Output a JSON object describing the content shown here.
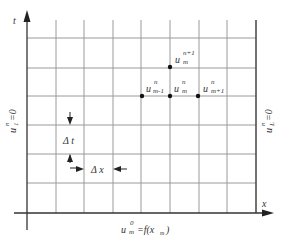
{
  "axes": {
    "t_label": "t",
    "x_label": "x"
  },
  "grid": {
    "columns_x": [
      27,
      56,
      84,
      113,
      141,
      170,
      199,
      227,
      256
    ],
    "rows_y": [
      38,
      68,
      97,
      125,
      154,
      183,
      213
    ],
    "line_color": "#9a9a9a",
    "axis_color": "#333333"
  },
  "nodes": [
    {
      "id": "u_m_n1",
      "base": "u",
      "sup": "n+1",
      "sub": "m",
      "x": 170,
      "y": 67
    },
    {
      "id": "u_m-1_n",
      "base": "u",
      "sup": "n",
      "sub": "m-1",
      "x": 142,
      "y": 95
    },
    {
      "id": "u_m_n",
      "base": "u",
      "sup": "n",
      "sub": "m",
      "x": 170,
      "y": 95
    },
    {
      "id": "u_m+1_n",
      "base": "u",
      "sup": "n",
      "sub": "m+1",
      "x": 198,
      "y": 95
    }
  ],
  "labels": {
    "left_boundary": {
      "base": "u",
      "sup": "n",
      "sub": "1",
      "rest": "=0"
    },
    "right_boundary": {
      "base": "u",
      "sup": "n",
      "sub": "L",
      "rest": "=0"
    },
    "initial_condition": {
      "base": "u",
      "sup": "0",
      "sub": "m",
      "rest": "=f(x",
      "rest_sub": "m",
      "close": ")"
    },
    "delta_t": "Δ t",
    "delta_x": "Δ x"
  }
}
